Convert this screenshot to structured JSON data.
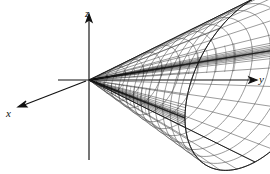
{
  "figure": {
    "title_fragment": "",
    "caption": "",
    "background_color": "#ffffff",
    "line_color": "#1a1a1a",
    "mesh_color": "#555555",
    "crease_color": "#000000"
  },
  "axes": {
    "z": {
      "label": "z",
      "name": "z-axis",
      "direction": "up"
    },
    "y": {
      "label": "y",
      "name": "y-axis",
      "direction": "right"
    },
    "x": {
      "label": "x",
      "name": "x-axis",
      "direction": "down-left"
    }
  },
  "chart_data": {
    "type": "surface-3d-wireframe",
    "title": "",
    "xlabel": "x",
    "ylabel": "y",
    "zlabel": "z",
    "surface": "elliptic double cone opening along positive y",
    "equation": "y^2 = x^2 + z^2,  y >= 0",
    "projection": {
      "origin_px": [
        89,
        80
      ],
      "y_axis_px_per_unit": [
        41.5,
        0
      ],
      "x_axis_px_per_unit": [
        -17.5,
        9.5
      ],
      "z_axis_px_per_unit": [
        0,
        -20.5
      ]
    },
    "parameters": {
      "y_range": [
        0,
        4.0
      ],
      "theta_range_deg": [
        0,
        360
      ],
      "u_steps": 13,
      "v_steps": 24,
      "radius_of_y": "r = y"
    },
    "grid": false,
    "legend": null,
    "annotations": []
  }
}
